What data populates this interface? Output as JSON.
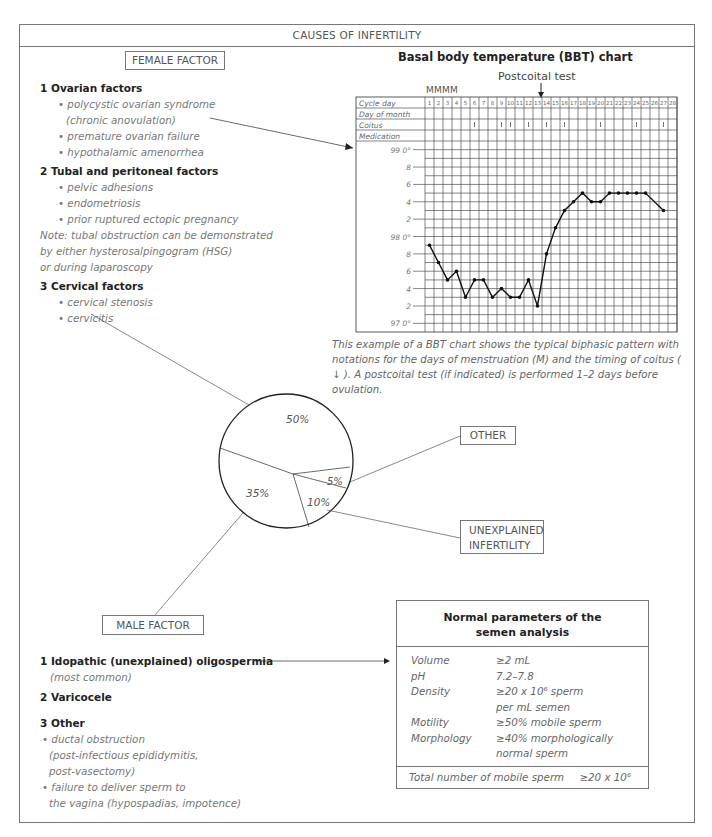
{
  "title": "CAUSES OF INFERTILITY",
  "female": {
    "label": "FEMALE FACTOR",
    "sections": [
      {
        "heading": "1 Ovarian factors",
        "items": [
          "• polycystic ovarian syndrome",
          "(chronic anovulation)",
          "• premature ovarian failure",
          "• hypothalamic amenorrhea"
        ]
      },
      {
        "heading": "2 Tubal and peritoneal factors",
        "items": [
          "• pelvic adhesions",
          "• endometriosis",
          "• prior ruptured ectopic pregnancy"
        ]
      },
      {
        "heading": "3 Cervical factors",
        "items": [
          "• cervical stenosis",
          "• cervicitis"
        ]
      }
    ],
    "note_lines": [
      "Note: tubal obstruction can be demonstrated",
      "by either hysterosalpingogram (HSG)",
      "or during laparoscopy"
    ]
  },
  "bbt": {
    "title": "Basal body temperature (BBT) chart",
    "postcoital_label": "Postcoital test",
    "menses_marks": "MMMM",
    "row_labels": [
      "Cycle day",
      "Day of month",
      "Coitus",
      "Medication"
    ],
    "y_labels": [
      "99 0°",
      "8",
      "6",
      "4",
      "2",
      "98 0°",
      "8",
      "6",
      "4",
      "2",
      "97 0°"
    ],
    "caption": "This example of a BBT chart shows the typical biphasic pattern with notations for the days of menstruation (M) and the timing of coitus ( ↓ ). A postcoital test (if indicated) is performed 1–2 days before ovulation."
  },
  "chart_data": [
    {
      "type": "line",
      "title": "Basal body temperature (BBT) chart",
      "xlabel": "Cycle day",
      "ylabel": "Temperature (°F)",
      "x": [
        1,
        2,
        3,
        4,
        5,
        6,
        7,
        8,
        9,
        10,
        11,
        12,
        13,
        14,
        15,
        16,
        17,
        18,
        19,
        20,
        21,
        22,
        23,
        24,
        25,
        26,
        27,
        28
      ],
      "series": [
        {
          "name": "BBT",
          "values": [
            97.9,
            97.7,
            97.5,
            97.6,
            97.3,
            97.5,
            97.5,
            97.3,
            97.4,
            97.3,
            97.3,
            97.5,
            97.2,
            97.8,
            98.1,
            98.3,
            98.4,
            98.5,
            98.4,
            98.4,
            98.5,
            98.5,
            98.5,
            98.5,
            98.5,
            null,
            98.3,
            null
          ]
        }
      ],
      "ylim": [
        96.9,
        99.1
      ],
      "menstruation_days": [
        1,
        2,
        3,
        4
      ],
      "coitus_days": [
        6,
        9,
        10,
        12,
        14,
        16,
        20,
        24,
        27
      ],
      "postcoital_test_day": 13,
      "grid": true
    },
    {
      "type": "pie",
      "title": "Causes of infertility",
      "categories": [
        "Female factor",
        "Male factor",
        "Unexplained infertility",
        "Other"
      ],
      "values": [
        50,
        35,
        10,
        5
      ],
      "labels": [
        "50%",
        "35%",
        "10%",
        "5%"
      ]
    }
  ],
  "pie": {
    "labels": {
      "female": "50%",
      "male": "35%",
      "unexplained": "10%",
      "other": "5%"
    },
    "other_label": "OTHER",
    "unexplained_label_lines": [
      "UNEXPLAINED",
      "INFERTILITY"
    ]
  },
  "male": {
    "label": "MALE FACTOR",
    "item1": "1 Idopathic (unexplained) oligospermia",
    "item1_sub": "(most common)",
    "item2": "2 Varicocele",
    "item3": "3 Other",
    "item3_lines": [
      "• ductal obstruction",
      "(post-infectious epididymitis,",
      "post-vasectomy)",
      "• failure to deliver sperm to",
      "the vagina (hypospadias, impotence)"
    ]
  },
  "semen": {
    "title_lines": [
      "Normal parameters of the",
      "semen analysis"
    ],
    "rows": [
      {
        "key": "Volume",
        "value": "≥2 mL"
      },
      {
        "key": "pH",
        "value": "7.2–7.8"
      },
      {
        "key": "Density",
        "value": "≥20 x 10⁶ sperm"
      },
      {
        "key": "",
        "value": "per mL semen"
      },
      {
        "key": "Motility",
        "value": "≥50% mobile sperm"
      },
      {
        "key": "Morphology",
        "value": "≥40% morphologically"
      },
      {
        "key": "",
        "value": "normal sperm"
      }
    ],
    "total_key": "Total number of mobile sperm",
    "total_value": "≥20 x 10⁶"
  }
}
